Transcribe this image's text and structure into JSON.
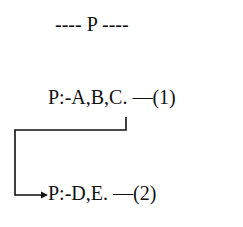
{
  "title": "---- P ----",
  "rules": [
    {
      "id": 1,
      "text": "P:-A,B,C. —(1)"
    },
    {
      "id": 2,
      "text": "P:-D,E. —(2)"
    }
  ],
  "connector": {
    "from": "rule-1 (B)",
    "to": "rule-2",
    "icon": "arrow-right-icon"
  }
}
